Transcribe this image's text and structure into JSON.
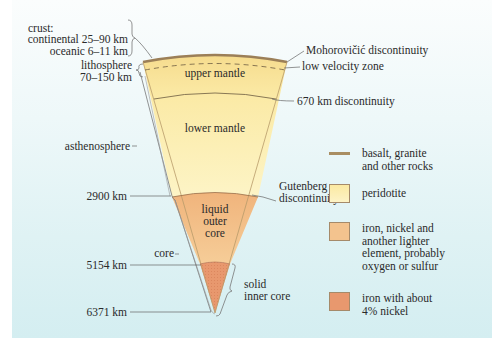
{
  "colors": {
    "crust": "#a98e62",
    "mantle": "#fbeaa6",
    "mantle_light": "#fdf3c4",
    "outer_core": "#f3c38e",
    "inner_core": "#e8986e",
    "line": "#5a5a5a"
  },
  "left_labels": {
    "crust_title": "crust:",
    "crust_continental": "continental 25–90 km",
    "crust_oceanic": "oceanic 6–11 km",
    "lithosphere": "lithosphere",
    "lithosphere_depth": "70–150 km",
    "asthenosphere": "asthenosphere",
    "depth_2900": "2900 km",
    "core": "core",
    "depth_5154": "5154 km",
    "depth_6371": "6371 km"
  },
  "layers": {
    "upper_mantle": "upper mantle",
    "lower_mantle": "lower mantle",
    "outer_core_1": "liquid",
    "outer_core_2": "outer",
    "outer_core_3": "core",
    "inner_core_1": "solid",
    "inner_core_2": "inner core"
  },
  "right_labels": {
    "moho": "Mohorovičić discontinuity",
    "lvz": "low velocity zone",
    "d670": "670 km discontinuity",
    "gutenberg_1": "Gutenberg",
    "gutenberg_2": "discontinuity"
  },
  "legend": [
    {
      "kind": "line",
      "lines": [
        "basalt, granite",
        "and other rocks"
      ]
    },
    {
      "kind": "swatch",
      "color": "#fcefae",
      "lines": [
        "peridotite"
      ]
    },
    {
      "kind": "swatch",
      "color": "#f3c38e",
      "lines": [
        "iron, nickel and",
        "another lighter",
        "element, probably",
        "oxygen or sulfur"
      ]
    },
    {
      "kind": "swatch",
      "color": "#e8986e",
      "lines": [
        "iron with about",
        "4% nickel"
      ]
    }
  ]
}
